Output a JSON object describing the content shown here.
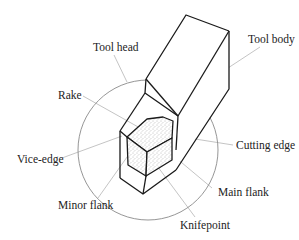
{
  "figure": {
    "labels": {
      "tool_head": "Tool head",
      "tool_body": "Tool body",
      "rake": "Rake",
      "cutting_edge": "Cutting edge",
      "vice_edge": "Vice-edge",
      "main_flank": "Main flank",
      "minor_flank": "Minor flank",
      "knifepoint": "Knifepoint"
    },
    "colors": {
      "edge": "#1a1a1a",
      "leader": "#bdbdbd",
      "circle": "#8a8a8a",
      "rake_stipple": "#777777"
    }
  }
}
